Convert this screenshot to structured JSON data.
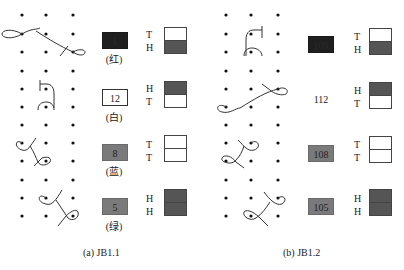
{
  "figure": {
    "panels": [
      {
        "id": "a",
        "caption": "(a) JB1.1",
        "rows": [
          {
            "tile_value": "1",
            "tile_style": "dark",
            "color_label": "(红)",
            "face_top": "T",
            "face_bottom": "H",
            "box_top": "light",
            "box_bottom": "dark"
          },
          {
            "tile_value": "12",
            "tile_style": "white",
            "color_label": "(白)",
            "face_top": "H",
            "face_bottom": "T",
            "box_top": "dark",
            "box_bottom": "light"
          },
          {
            "tile_value": "8",
            "tile_style": "gray",
            "color_label": "(蓝)",
            "face_top": "T",
            "face_bottom": "T",
            "box_top": "light",
            "box_bottom": "light"
          },
          {
            "tile_value": "5",
            "tile_style": "gray",
            "color_label": "(绿)",
            "face_top": "H",
            "face_bottom": "H",
            "box_top": "dark",
            "box_bottom": "dark"
          }
        ]
      },
      {
        "id": "b",
        "caption": "(b) JB1.2",
        "rows": [
          {
            "tile_value": "109",
            "tile_style": "dark",
            "color_label": "",
            "face_top": "T",
            "face_bottom": "H",
            "box_top": "light",
            "box_bottom": "dark"
          },
          {
            "tile_value": "112",
            "tile_style": "plain",
            "color_label": "",
            "face_top": "H",
            "face_bottom": "T",
            "box_top": "dark",
            "box_bottom": "light"
          },
          {
            "tile_value": "108",
            "tile_style": "gray",
            "color_label": "",
            "face_top": "T",
            "face_bottom": "T",
            "box_top": "light",
            "box_bottom": "light"
          },
          {
            "tile_value": "105",
            "tile_style": "gray",
            "color_label": "",
            "face_top": "H",
            "face_bottom": "H",
            "box_top": "dark",
            "box_bottom": "dark"
          }
        ]
      }
    ],
    "colors": {
      "dark_tile": "#1f1f1f",
      "gray_tile": "#7a7a7a",
      "dark_half": "#555555",
      "stroke": "#333333"
    }
  }
}
